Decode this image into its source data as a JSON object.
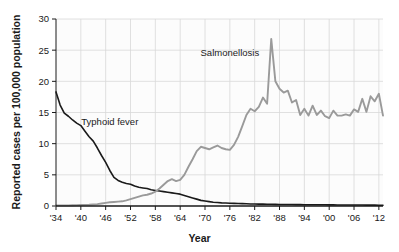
{
  "chart_data": {
    "type": "line",
    "title": "",
    "xlabel": "Year",
    "ylabel": "Reported cases per 100,000 population",
    "xlim": [
      1934,
      2013
    ],
    "ylim": [
      0,
      30
    ],
    "grid": true,
    "legend_position": "inline-annotations",
    "xticks": [
      1934,
      1940,
      1946,
      1952,
      1958,
      1964,
      1970,
      1976,
      1982,
      1988,
      1994,
      2000,
      2006,
      2012
    ],
    "xtick_labels": [
      "'34",
      "'40",
      "'46",
      "'52",
      "'58",
      "'64",
      "'70",
      "'76",
      "'82",
      "'88",
      "'94",
      "'00",
      "'06",
      "'12"
    ],
    "yticks": [
      0,
      5,
      10,
      15,
      20,
      25,
      30
    ],
    "ytick_labels": [
      "0",
      "5",
      "10",
      "15",
      "20",
      "25",
      "30"
    ],
    "annotations": [
      {
        "text": "Salmonellosis",
        "x": 1976,
        "y": 24.0,
        "color": "#1a1a1a"
      },
      {
        "text": "Typhoid fever",
        "x": 1947,
        "y": 13.0,
        "color": "#1a1a1a"
      }
    ],
    "series": [
      {
        "name": "Typhoid fever",
        "color": "#1a1a1a",
        "width": 1.6,
        "x": [
          1934,
          1935,
          1936,
          1937,
          1938,
          1939,
          1940,
          1941,
          1942,
          1943,
          1944,
          1945,
          1946,
          1947,
          1948,
          1949,
          1950,
          1951,
          1952,
          1953,
          1954,
          1955,
          1956,
          1957,
          1958,
          1959,
          1960,
          1961,
          1962,
          1963,
          1964,
          1965,
          1966,
          1967,
          1968,
          1969,
          1970,
          1971,
          1972,
          1973,
          1974,
          1975,
          1976,
          1977,
          1978,
          1979,
          1980,
          1981,
          1982,
          1983,
          1984,
          1985,
          1986,
          1987,
          1988,
          1989,
          1990,
          1991,
          1992,
          1993,
          1994,
          1995,
          1996,
          1997,
          1998,
          1999,
          2000,
          2001,
          2002,
          2003,
          2004,
          2005,
          2006,
          2007,
          2008,
          2009,
          2010,
          2011,
          2012,
          2013
        ],
        "y": [
          18.3,
          16.2,
          14.9,
          14.4,
          13.8,
          13.3,
          12.9,
          12.0,
          11.1,
          10.4,
          9.3,
          8.1,
          7.0,
          5.7,
          4.6,
          4.1,
          3.8,
          3.6,
          3.5,
          3.2,
          3.0,
          2.9,
          2.8,
          2.6,
          2.5,
          2.4,
          2.3,
          2.2,
          2.1,
          2.0,
          1.9,
          1.7,
          1.5,
          1.3,
          1.1,
          0.9,
          0.8,
          0.7,
          0.6,
          0.55,
          0.5,
          0.48,
          0.45,
          0.42,
          0.4,
          0.38,
          0.35,
          0.33,
          0.32,
          0.3,
          0.3,
          0.28,
          0.27,
          0.26,
          0.25,
          0.25,
          0.24,
          0.23,
          0.22,
          0.22,
          0.21,
          0.2,
          0.2,
          0.2,
          0.19,
          0.19,
          0.18,
          0.18,
          0.17,
          0.17,
          0.16,
          0.16,
          0.15,
          0.15,
          0.15,
          0.14,
          0.14,
          0.14,
          0.13,
          0.13
        ]
      },
      {
        "name": "Salmonellosis",
        "color": "#9a9a9a",
        "width": 1.9,
        "x": [
          1934,
          1935,
          1936,
          1937,
          1938,
          1939,
          1940,
          1941,
          1942,
          1943,
          1944,
          1945,
          1946,
          1947,
          1948,
          1949,
          1950,
          1951,
          1952,
          1953,
          1954,
          1955,
          1956,
          1957,
          1958,
          1959,
          1960,
          1961,
          1962,
          1963,
          1964,
          1965,
          1966,
          1967,
          1968,
          1969,
          1970,
          1971,
          1972,
          1973,
          1974,
          1975,
          1976,
          1977,
          1978,
          1979,
          1980,
          1981,
          1982,
          1983,
          1984,
          1985,
          1986,
          1987,
          1988,
          1989,
          1990,
          1991,
          1992,
          1993,
          1994,
          1995,
          1996,
          1997,
          1998,
          1999,
          2000,
          2001,
          2002,
          2003,
          2004,
          2005,
          2006,
          2007,
          2008,
          2009,
          2010,
          2011,
          2012,
          2013
        ],
        "y": [
          0.1,
          0.1,
          0.1,
          0.1,
          0.12,
          0.14,
          0.16,
          0.18,
          0.2,
          0.25,
          0.3,
          0.4,
          0.5,
          0.6,
          0.65,
          0.7,
          0.75,
          0.9,
          1.1,
          1.3,
          1.5,
          1.7,
          1.8,
          2.0,
          2.3,
          2.8,
          3.4,
          4.0,
          4.3,
          4.0,
          4.2,
          5.0,
          6.3,
          7.5,
          8.8,
          9.5,
          9.3,
          9.1,
          9.4,
          9.7,
          9.3,
          9.1,
          9.0,
          9.8,
          11.1,
          12.8,
          14.6,
          15.6,
          15.2,
          15.9,
          17.4,
          16.4,
          26.8,
          20.0,
          18.8,
          18.2,
          18.5,
          16.6,
          17.0,
          14.6,
          15.6,
          14.5,
          16.1,
          14.6,
          15.3,
          14.4,
          14.1,
          15.3,
          14.5,
          14.5,
          14.7,
          14.5,
          15.5,
          15.1,
          17.2,
          15.1,
          17.6,
          16.8,
          18.0,
          14.5
        ]
      }
    ]
  },
  "axes": {
    "frame_color": "#9a9a9a",
    "grid_color": "#d8d8d8",
    "text_color": "#1a1a1a",
    "plot_bg": "#fcfcfc"
  }
}
